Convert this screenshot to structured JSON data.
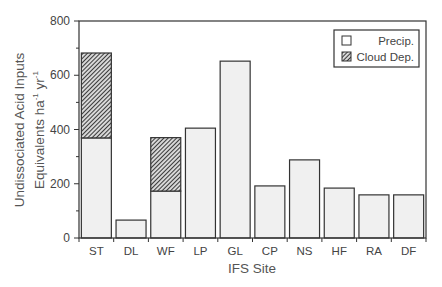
{
  "chart_data": {
    "type": "bar",
    "stacked": true,
    "title": "",
    "xlabel": "IFS Site",
    "ylabel_line1": "Undissociated Acid Inputs",
    "ylabel_line2": "Equivalents ha",
    "ylabel_sup1": "-1",
    "ylabel_unit2": " yr",
    "ylabel_sup2": "-1",
    "ylabel": "Undissociated Acid Inputs Equivalents ha-1 yr-1",
    "ylim": [
      0,
      800
    ],
    "yticks": [
      0,
      200,
      400,
      600,
      800
    ],
    "yminor_ticks": [
      100,
      300,
      500,
      700
    ],
    "grid": false,
    "legend_position": "upper right",
    "categories": [
      "ST",
      "DL",
      "WF",
      "LP",
      "GL",
      "CP",
      "NS",
      "HF",
      "RA",
      "DF"
    ],
    "series": [
      {
        "name": "Precip.",
        "pattern": "solid-light",
        "color": "#f0f0f0",
        "values": [
          369,
          66,
          173,
          405,
          652,
          192,
          288,
          184,
          159,
          159
        ]
      },
      {
        "name": "Cloud Dep.",
        "pattern": "diagonal-hatch",
        "color": "#555555",
        "values": [
          313,
          0,
          197,
          0,
          0,
          0,
          0,
          0,
          0,
          0
        ]
      }
    ]
  },
  "legend": {
    "items": [
      {
        "label": "Precip.",
        "swatch": "open-box"
      },
      {
        "label": "Cloud Dep.",
        "swatch": "hatched-box"
      }
    ]
  },
  "colors": {
    "axis": "#333333",
    "precip_fill": "#f0f0f0",
    "cloud_hatch": "#555555"
  }
}
